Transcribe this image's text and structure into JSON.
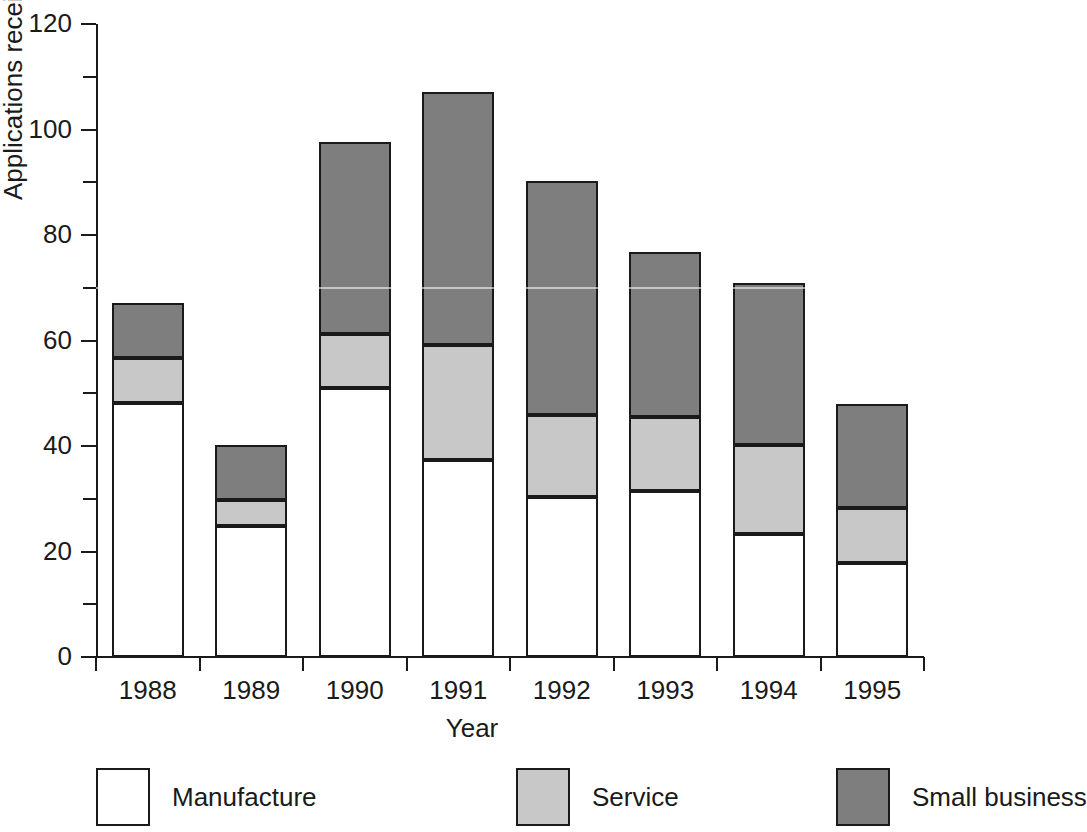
{
  "chart_data": {
    "type": "bar",
    "stacked": true,
    "title": "",
    "xlabel": "Year",
    "ylabel": "Applications received",
    "categories": [
      "1988",
      "1989",
      "1990",
      "1991",
      "1992",
      "1993",
      "1994",
      "1995"
    ],
    "ylim": [
      0,
      120
    ],
    "yticks": [
      0,
      20,
      40,
      60,
      80,
      100,
      120
    ],
    "ytick_labels": [
      "0",
      "20",
      "40",
      "60",
      "80",
      "100",
      "120"
    ],
    "yticks_minor": [
      10,
      30,
      50,
      70,
      90,
      110
    ],
    "grid": false,
    "legend_position": "bottom",
    "series": [
      {
        "name": "Manufacture",
        "color": "#ffffff",
        "values": [
          48.2,
          24.8,
          51.0,
          37.3,
          30.3,
          31.5,
          23.3,
          17.8
        ]
      },
      {
        "name": "Service",
        "color": "#c8c8c8",
        "values": [
          8.5,
          5.0,
          10.2,
          21.8,
          15.6,
          14.0,
          16.9,
          10.4
        ]
      },
      {
        "name": "Small business",
        "color": "#7e7e7e",
        "values": [
          10.4,
          10.4,
          36.4,
          48.0,
          44.3,
          31.3,
          30.7,
          19.8
        ]
      }
    ],
    "stack_tops": {
      "manufacture": [
        48.2,
        24.8,
        51.0,
        37.3,
        30.3,
        31.5,
        23.3,
        17.8
      ],
      "service": [
        56.7,
        29.8,
        61.2,
        59.1,
        45.9,
        45.5,
        40.2,
        28.2
      ],
      "total": [
        67.1,
        40.2,
        97.6,
        107.1,
        90.2,
        76.8,
        70.9,
        48.0
      ]
    }
  },
  "axes": {
    "y_title": "Applications received",
    "x_title": "Year"
  },
  "legend": {
    "items": [
      {
        "label": "Manufacture",
        "swatch": "manufacture"
      },
      {
        "label": "Service",
        "swatch": "service"
      },
      {
        "label": "Small business",
        "swatch": "smallbiz"
      }
    ]
  },
  "colors": {
    "manufacture": "#ffffff",
    "service": "#c8c8c8",
    "small_business": "#7e7e7e",
    "axis": "#1a1a1a",
    "background": "#ffffff"
  }
}
